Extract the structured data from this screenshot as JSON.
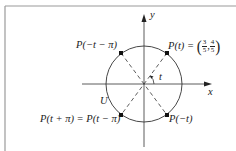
{
  "diagram": {
    "type": "unit-circle",
    "circle_label": "U",
    "axes": {
      "x_label": "x",
      "y_label": "y"
    },
    "angle_label": "t",
    "points": [
      {
        "id": "p_t",
        "label_prefix": "P(t) = ",
        "coord_x_num": "3",
        "coord_x_den": "5",
        "coord_y_num": "4",
        "coord_y_den": "5",
        "quadrant": "I"
      },
      {
        "id": "p_neg_t_minus_pi",
        "label": "P(−t − π)",
        "quadrant": "II"
      },
      {
        "id": "p_t_plus_pi",
        "label": "P(t + π) = P(t − π)",
        "quadrant": "III"
      },
      {
        "id": "p_neg_t",
        "label": "P(−t)",
        "quadrant": "IV"
      }
    ],
    "colors": {
      "stroke": "#333333",
      "frame": "#9a9a9a",
      "background": "#ffffff"
    }
  }
}
